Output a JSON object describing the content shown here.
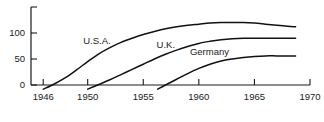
{
  "chart_data": {
    "type": "line",
    "title": "",
    "subtitle": "",
    "xlabel": "",
    "ylabel": "",
    "xlim": [
      1944.9,
      1970
    ],
    "ylim": [
      -10,
      150
    ],
    "grid": false,
    "legend_position": "inline-annotations",
    "x_ticks": [
      1946,
      1950,
      1955,
      1960,
      1965,
      1970
    ],
    "x_tick_labels": [
      "1946",
      "1950",
      "1955",
      "1960",
      "1965",
      "1970"
    ],
    "y_ticks": [
      0,
      50,
      100,
      150
    ],
    "y_tick_labels": [
      "0",
      "50",
      "100",
      ""
    ],
    "annotations": [
      {
        "text": "U.S.A.",
        "x": 1949.6,
        "y": 78
      },
      {
        "text": "U.K.",
        "x": 1956.2,
        "y": 71
      },
      {
        "text": "Germany",
        "x": 1959.2,
        "y": 58
      }
    ],
    "series": [
      {
        "name": "U.S.A.",
        "color": "#111111",
        "x": [
          1946.0,
          1947.0,
          1948.0,
          1949.0,
          1950.0,
          1951.0,
          1952.0,
          1953.0,
          1954.0,
          1955.0,
          1956.0,
          1957.0,
          1958.0,
          1959.0,
          1960.0,
          1961.0,
          1962.0,
          1963.0,
          1964.0,
          1965.0,
          1966.0,
          1967.0,
          1968.0,
          1968.7
        ],
        "values": [
          -8,
          2,
          14,
          29,
          45,
          60,
          72,
          82,
          90,
          97,
          103,
          108,
          112,
          115,
          117,
          119,
          120,
          120,
          120,
          119,
          117,
          115,
          113,
          112
        ]
      },
      {
        "name": "U.K.",
        "color": "#111111",
        "x": [
          1950.0,
          1951.0,
          1952.0,
          1953.0,
          1954.0,
          1955.0,
          1956.0,
          1957.0,
          1958.0,
          1959.0,
          1960.0,
          1961.0,
          1962.0,
          1963.0,
          1964.0,
          1965.0,
          1966.0,
          1967.0,
          1968.0,
          1968.7
        ],
        "values": [
          -8,
          1,
          10,
          20,
          30,
          40,
          50,
          59,
          67,
          74,
          80,
          84,
          87,
          89,
          90,
          90,
          90,
          90,
          90,
          90
        ]
      },
      {
        "name": "Germany",
        "color": "#111111",
        "x": [
          1956.3,
          1957.0,
          1958.0,
          1959.0,
          1960.0,
          1961.0,
          1962.0,
          1963.0,
          1964.0,
          1965.0,
          1966.0,
          1967.0,
          1968.0,
          1968.7
        ],
        "values": [
          -8,
          0,
          11,
          22,
          32,
          40,
          46,
          50,
          53,
          55,
          56,
          56,
          56,
          56
        ]
      }
    ]
  },
  "axes": {
    "x_axis_name": "year-axis",
    "y_axis_name": "value-axis"
  }
}
